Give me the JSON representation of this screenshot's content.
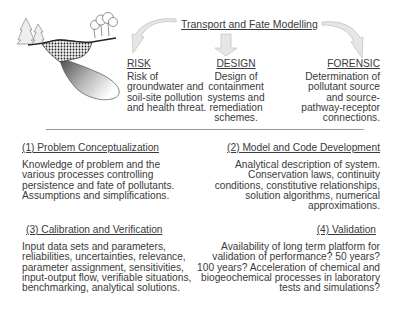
{
  "title": "Transport and Fate Modelling",
  "branches": [
    {
      "heading": "RISK",
      "lines": [
        "Risk of",
        "groundwater and",
        "soil-site pollution",
        "and health threat."
      ]
    },
    {
      "heading": "DESIGN",
      "lines": [
        "Design of",
        "containment",
        "systems and",
        "remediation",
        "schemes."
      ]
    },
    {
      "heading": "FORENSIC",
      "lines": [
        "Determination of",
        "pollutant source",
        "and source-",
        "pathway-receptor",
        "connections."
      ]
    }
  ],
  "steps": [
    {
      "heading": "(1) Problem Conceptualization",
      "lines": [
        "Knowledge of problem and the",
        "various processes controlling",
        "persistence and fate of pollutants.",
        "Assumptions and simplifications."
      ]
    },
    {
      "heading": "(2) Model and Code Development",
      "lines": [
        "Analytical description of system.",
        "Conservation laws, continuity",
        "conditions, constitutive relationships,",
        "solution algorithms, numerical",
        "approximations."
      ]
    },
    {
      "heading": "(3) Calibration and Verification",
      "lines": [
        "Input data sets and parameters,",
        "reliabilities, uncertainties, relevance,",
        "parameter assignment, sensitivities,",
        "input-output flow, verifiable situations,",
        "benchmarking, analytical solutions."
      ]
    },
    {
      "heading": "(4) Validation",
      "lines": [
        "Availability of long term platform for",
        "validation of performance? 50 years?",
        "100 years? Acceleration of chemical and",
        "biogeochemical processes in  laboratory",
        "tests and simulations?"
      ]
    }
  ],
  "colors": {
    "text": "#3a3a3a",
    "arrow_fill": "#e6e6e6",
    "arrow_stroke": "#c4c4c4",
    "divider": "#9a9a9a"
  }
}
